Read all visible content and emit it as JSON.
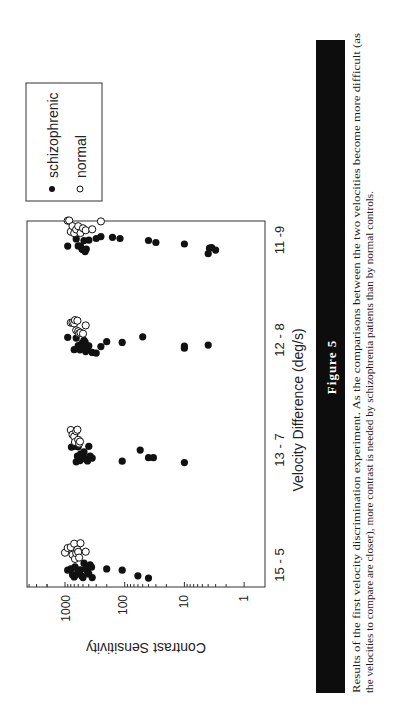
{
  "figure": {
    "label": "Figure 5",
    "caption_lines": [
      "Results of the first velocity discrimination experiment. As the comparisons between the two velocities become more difficult (as",
      "the velocities to compare are closer), more contrast is needed by schizophrenia patients than by normal controls."
    ]
  },
  "legend": {
    "items": [
      {
        "label": "schizophrenic",
        "marker": "filled-circle"
      },
      {
        "label": "normal",
        "marker": "open-circle"
      }
    ]
  },
  "chart_data": {
    "type": "scatter",
    "title": "",
    "xlabel": "Velocity Difference (deg/s)",
    "ylabel": "Contrast Sensitivity",
    "categories": [
      "15 - 5",
      "13 - 7",
      "12 - 8",
      "11 -9"
    ],
    "y_scale": "log",
    "y_ticks": [
      "1000",
      "100",
      "10",
      "1"
    ],
    "ylim": [
      0.8,
      3000
    ],
    "grid": false,
    "legend_position": "upper-left outside",
    "series": [
      {
        "name": "schizophrenic",
        "marker": "filled-circle",
        "points": [
          {
            "category": "15 - 5",
            "values": [
              900,
              800,
              700,
              650,
              600,
              550,
              500,
              480,
              450,
              420,
              400,
              380,
              360,
              350,
              600,
              750,
              680,
              520,
              200,
              110,
              60,
              40
            ]
          },
          {
            "category": "13 - 7",
            "values": [
              780,
              700,
              650,
              620,
              600,
              560,
              520,
              500,
              480,
              450,
              420,
              400,
              380,
              600,
              550,
              350,
              110,
              55,
              40,
              33,
              10
            ]
          },
          {
            "category": "12 - 8",
            "values": [
              900,
              700,
              650,
              600,
              560,
              520,
              500,
              480,
              460,
              450,
              430,
              400,
              350,
              300,
              250,
              200,
              110,
              50,
              10,
              10,
              4
            ]
          },
          {
            "category": "11 -9",
            "values": [
              900,
              650,
              600,
              550,
              520,
              500,
              480,
              460,
              440,
              400,
              300,
              250,
              160,
              120,
              40,
              30,
              10,
              4,
              3.8,
              3.5,
              3
            ]
          }
        ]
      },
      {
        "name": "normal",
        "marker": "open-circle",
        "points": [
          {
            "category": "15 - 5",
            "values": [
              1000,
              900,
              800,
              750,
              700,
              680,
              650,
              620,
              600,
              580,
              550,
              450
            ]
          },
          {
            "category": "13 - 7",
            "values": [
              800,
              750,
              700,
              680,
              650,
              620,
              600,
              580,
              560
            ]
          },
          {
            "category": "12 - 8",
            "values": [
              800,
              750,
              700,
              680,
              650,
              620,
              600,
              580,
              550,
              500,
              450
            ]
          },
          {
            "category": "11 -9",
            "values": [
              900,
              850,
              800,
              750,
              700,
              650,
              600,
              550,
              500,
              450,
              350,
              250
            ]
          }
        ]
      }
    ]
  }
}
